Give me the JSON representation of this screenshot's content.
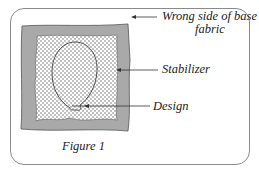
{
  "diagram": {
    "labels": {
      "wrong_side_line1": "Wrong side of base",
      "wrong_side_line2": "fabric",
      "stabilizer": "Stabilizer",
      "design": "Design"
    },
    "caption": "Figure 1",
    "colors": {
      "fabric": "#a9a9a9",
      "stabilizer": "#ffffff",
      "dots": "#555555",
      "frame": "#8a8a8a",
      "line": "#333333"
    }
  }
}
